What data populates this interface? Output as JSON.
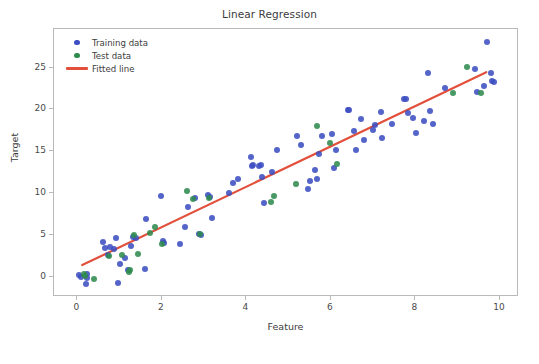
{
  "chart_data": {
    "type": "scatter",
    "title": "Linear Regression",
    "xlabel": "Feature",
    "ylabel": "Target",
    "xlim": [
      -0.55,
      10.45
    ],
    "ylim": [
      -2.4,
      29.6
    ],
    "xticks": [
      0,
      2,
      4,
      6,
      8,
      10
    ],
    "yticks": [
      0,
      5,
      10,
      15,
      20,
      25
    ],
    "grid": false,
    "legend_position": "upper left",
    "colors": {
      "training": "#3c4ec2",
      "test": "#2f8b4e",
      "fitted_line": "#e2503c",
      "frame": "#b9b9b9",
      "background": "#ffffff",
      "text": "#3c3c3c"
    },
    "series": [
      {
        "name": "Training data",
        "type": "scatter",
        "color": "#3c4ec2",
        "points": [
          [
            0.05,
            0.2
          ],
          [
            0.09,
            0.0
          ],
          [
            0.2,
            -0.9
          ],
          [
            0.22,
            0.3
          ],
          [
            0.24,
            -0.1
          ],
          [
            0.62,
            4.2
          ],
          [
            0.66,
            3.4
          ],
          [
            0.72,
            2.6
          ],
          [
            0.78,
            3.6
          ],
          [
            0.86,
            3.3
          ],
          [
            0.92,
            4.6
          ],
          [
            0.97,
            -0.7
          ],
          [
            1.0,
            1.5
          ],
          [
            1.12,
            2.2
          ],
          [
            1.2,
            0.8
          ],
          [
            1.26,
            3.7
          ],
          [
            1.32,
            4.8
          ],
          [
            1.38,
            4.6
          ],
          [
            1.6,
            1.0
          ],
          [
            1.62,
            6.9
          ],
          [
            1.97,
            9.7
          ],
          [
            2.02,
            4.3
          ],
          [
            2.05,
            4.1
          ],
          [
            2.42,
            3.9
          ],
          [
            2.55,
            5.9
          ],
          [
            2.62,
            8.4
          ],
          [
            2.78,
            9.4
          ],
          [
            2.88,
            5.1
          ],
          [
            2.93,
            5.0
          ],
          [
            3.1,
            9.8
          ],
          [
            3.14,
            9.5
          ],
          [
            3.18,
            7.0
          ],
          [
            3.6,
            10.0
          ],
          [
            3.68,
            11.2
          ],
          [
            3.8,
            11.7
          ],
          [
            4.1,
            14.3
          ],
          [
            4.13,
            13.3
          ],
          [
            4.16,
            13.4
          ],
          [
            4.3,
            13.3
          ],
          [
            4.34,
            13.4
          ],
          [
            4.38,
            11.9
          ],
          [
            4.42,
            8.8
          ],
          [
            4.6,
            12.5
          ],
          [
            4.72,
            15.1
          ],
          [
            5.2,
            16.8
          ],
          [
            5.3,
            15.7
          ],
          [
            5.45,
            10.5
          ],
          [
            5.5,
            11.4
          ],
          [
            5.62,
            12.8
          ],
          [
            5.66,
            11.7
          ],
          [
            5.72,
            14.7
          ],
          [
            5.78,
            16.8
          ],
          [
            6.02,
            17.1
          ],
          [
            6.08,
            13.0
          ],
          [
            6.12,
            15.1
          ],
          [
            6.4,
            19.9
          ],
          [
            6.44,
            19.9
          ],
          [
            6.55,
            17.4
          ],
          [
            6.6,
            15.2
          ],
          [
            6.72,
            18.9
          ],
          [
            6.78,
            16.4
          ],
          [
            7.0,
            17.5
          ],
          [
            7.05,
            18.1
          ],
          [
            7.18,
            19.7
          ],
          [
            7.22,
            16.6
          ],
          [
            7.45,
            18.3
          ],
          [
            7.72,
            21.2
          ],
          [
            7.78,
            21.3
          ],
          [
            7.82,
            19.6
          ],
          [
            7.95,
            19.0
          ],
          [
            8.02,
            17.2
          ],
          [
            8.2,
            18.6
          ],
          [
            8.3,
            24.4
          ],
          [
            8.34,
            19.8
          ],
          [
            8.42,
            18.3
          ],
          [
            8.7,
            22.5
          ],
          [
            9.4,
            24.8
          ],
          [
            9.45,
            22.1
          ],
          [
            9.62,
            22.8
          ],
          [
            9.7,
            28.1
          ],
          [
            9.78,
            24.3
          ],
          [
            9.82,
            23.4
          ],
          [
            9.85,
            23.3
          ]
        ]
      },
      {
        "name": "Test data",
        "type": "scatter",
        "color": "#2f8b4e",
        "points": [
          [
            0.17,
            0.4
          ],
          [
            0.19,
            0.1
          ],
          [
            0.4,
            -0.3
          ],
          [
            0.76,
            2.5
          ],
          [
            1.05,
            2.6
          ],
          [
            1.22,
            0.6
          ],
          [
            1.25,
            0.8
          ],
          [
            1.35,
            5.0
          ],
          [
            1.44,
            2.7
          ],
          [
            1.72,
            5.3
          ],
          [
            1.85,
            5.9
          ],
          [
            2.0,
            3.9
          ],
          [
            2.6,
            10.3
          ],
          [
            2.74,
            9.3
          ],
          [
            2.9,
            5.1
          ],
          [
            3.12,
            9.4
          ],
          [
            4.58,
            9.0
          ],
          [
            4.65,
            9.7
          ],
          [
            5.18,
            11.1
          ],
          [
            5.68,
            18.0
          ],
          [
            5.98,
            16.0
          ],
          [
            6.14,
            13.5
          ],
          [
            9.22,
            25.1
          ],
          [
            8.9,
            21.9
          ],
          [
            9.55,
            21.9
          ]
        ]
      },
      {
        "name": "Fitted line",
        "type": "line",
        "color": "#e2503c",
        "endpoints": [
          [
            0.12,
            1.2
          ],
          [
            9.72,
            24.4
          ]
        ],
        "slope": 2.42,
        "intercept": 0.91
      }
    ]
  },
  "legend": {
    "items": [
      {
        "label": "Training data",
        "marker": "dot",
        "color": "#3c4ec2"
      },
      {
        "label": "Test data",
        "marker": "dot",
        "color": "#2f8b4e"
      },
      {
        "label": "Fitted line",
        "marker": "line",
        "color": "#e2503c"
      }
    ]
  }
}
